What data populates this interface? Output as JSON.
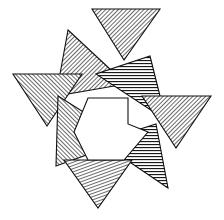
{
  "figure": {
    "background_color": "#ffffff",
    "stroke_color": "#111111",
    "hatch_color": "#1a1a1a",
    "canvas": {
      "width": 224,
      "height": 220
    },
    "bounds": {
      "left": 12,
      "top": 8,
      "right": 212,
      "bottom": 208
    },
    "symmetry": "4-fold rotational",
    "shape_count": 8,
    "hatch_styles": [
      {
        "id": "hatch-fwd",
        "name": "forward-diagonal",
        "angle_deg": 45,
        "spacing_px": 3
      },
      {
        "id": "hatch-back",
        "name": "backward-diagonal",
        "angle_deg": -45,
        "spacing_px": 3
      },
      {
        "id": "hatch-horiz",
        "name": "horizontal",
        "angle_deg": 0,
        "spacing_px": 3
      },
      {
        "id": "hatch-steep",
        "name": "steep-diagonal",
        "angle_deg": 70,
        "spacing_px": 3
      }
    ],
    "shapes": [
      {
        "name": "triangle-top",
        "points": "92,9 160,9 124,60",
        "hatch": "hatch-fwd",
        "orientation": "points-down"
      },
      {
        "name": "triangle-upper-left",
        "points": "68,30 126,84 56,96",
        "hatch": "hatch-fwd",
        "orientation": "points-left"
      },
      {
        "name": "triangle-upper-right",
        "points": "150,56 166,120 96,74",
        "hatch": "hatch-horiz",
        "orientation": "points-left"
      },
      {
        "name": "triangle-left",
        "points": "13,74 82,74 47,126",
        "hatch": "hatch-back",
        "orientation": "points-down"
      },
      {
        "name": "triangle-right",
        "points": "142,96 211,96 176,148",
        "hatch": "hatch-fwd",
        "orientation": "points-down"
      },
      {
        "name": "triangle-lower-left",
        "points": "58,96 128,140 56,166",
        "hatch": "hatch-back",
        "orientation": "points-right"
      },
      {
        "name": "triangle-lower-right",
        "points": "156,124 168,188 100,142",
        "hatch": "hatch-horiz",
        "orientation": "points-left"
      },
      {
        "name": "triangle-bottom",
        "points": "64,160 132,160 98,208",
        "hatch": "hatch-steep",
        "orientation": "points-down"
      }
    ],
    "central_void": {
      "name": "central-hole",
      "points": "88,98 128,98 128,124 148,132 124,160 88,160 74,132",
      "fill": "#ffffff"
    }
  }
}
